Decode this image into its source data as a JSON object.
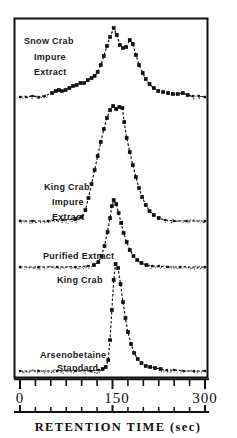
{
  "figure": {
    "domain": "chart",
    "background_color": "#ffffff",
    "ink_color": "#101010",
    "frame": {
      "left": 14,
      "top": 18,
      "right": 208,
      "bottom": 378
    }
  },
  "axis": {
    "x_title": "RETENTION  TIME   (sec)",
    "x_tick_labels": [
      "0",
      "150",
      "300"
    ],
    "x_tick_label_values": [
      0,
      150,
      300
    ],
    "x_minor_ticks": [
      25,
      50,
      75,
      100,
      125,
      175,
      200,
      225,
      250,
      275
    ],
    "x_min": 0,
    "x_max": 300,
    "x_units": "sec",
    "y_axis_label": "",
    "y_ticks_shown": false,
    "grid": false
  },
  "labels": {
    "trace1_line1": "Snow Crab",
    "trace1_line2": "Impure",
    "trace1_line3": "Extract",
    "trace2_line1": "King Crab",
    "trace2_line2": "Impure",
    "trace2_line3": "Extract",
    "trace3_line1": "Purified Extract",
    "trace3_line2": "King Crab",
    "trace4_line1": "Arsenobetaine",
    "trace4_line2": "Standard"
  },
  "chart_data": {
    "type": "line",
    "title": "",
    "subtitle": "",
    "xlabel": "RETENTION  TIME   (sec)",
    "ylabel": "",
    "xlim": [
      0,
      300
    ],
    "grid": false,
    "legend": "inline-annotations",
    "marker": "filled-square",
    "line_style": "dotted-dashed",
    "note": "Four stacked HPLC chromatogram traces with offset baselines; y is detector response in arbitrary units relative to each trace's own baseline.",
    "series": [
      {
        "name": "Snow Crab Impure Extract",
        "baseline_y_px": 98,
        "peak_retention_sec": 152,
        "secondary_peak_retention_sec": 178,
        "points": [
          {
            "x": 0,
            "y": 1
          },
          {
            "x": 10,
            "y": 1
          },
          {
            "x": 20,
            "y": 2
          },
          {
            "x": 30,
            "y": 1
          },
          {
            "x": 40,
            "y": 2
          },
          {
            "x": 52,
            "y": 5
          },
          {
            "x": 58,
            "y": 7
          },
          {
            "x": 63,
            "y": 8
          },
          {
            "x": 68,
            "y": 7
          },
          {
            "x": 74,
            "y": 8
          },
          {
            "x": 80,
            "y": 10
          },
          {
            "x": 86,
            "y": 12
          },
          {
            "x": 92,
            "y": 13
          },
          {
            "x": 98,
            "y": 15
          },
          {
            "x": 104,
            "y": 15
          },
          {
            "x": 110,
            "y": 18
          },
          {
            "x": 116,
            "y": 20
          },
          {
            "x": 121,
            "y": 22
          },
          {
            "x": 126,
            "y": 26
          },
          {
            "x": 131,
            "y": 33
          },
          {
            "x": 136,
            "y": 42
          },
          {
            "x": 141,
            "y": 52
          },
          {
            "x": 146,
            "y": 61
          },
          {
            "x": 152,
            "y": 70
          },
          {
            "x": 157,
            "y": 63
          },
          {
            "x": 162,
            "y": 53
          },
          {
            "x": 167,
            "y": 50
          },
          {
            "x": 172,
            "y": 51
          },
          {
            "x": 178,
            "y": 58
          },
          {
            "x": 183,
            "y": 54
          },
          {
            "x": 188,
            "y": 43
          },
          {
            "x": 193,
            "y": 33
          },
          {
            "x": 199,
            "y": 25
          },
          {
            "x": 204,
            "y": 19
          },
          {
            "x": 210,
            "y": 14
          },
          {
            "x": 217,
            "y": 10
          },
          {
            "x": 224,
            "y": 7
          },
          {
            "x": 232,
            "y": 6
          },
          {
            "x": 240,
            "y": 5
          },
          {
            "x": 248,
            "y": 4
          },
          {
            "x": 256,
            "y": 4
          },
          {
            "x": 264,
            "y": 5
          },
          {
            "x": 272,
            "y": 3
          },
          {
            "x": 280,
            "y": 2
          },
          {
            "x": 290,
            "y": 2
          },
          {
            "x": 300,
            "y": 1
          }
        ]
      },
      {
        "name": "King Crab Impure Extract",
        "baseline_y_px": 222,
        "peak_retention_sec": 151,
        "points": [
          {
            "x": 0,
            "y": 1
          },
          {
            "x": 20,
            "y": 1
          },
          {
            "x": 45,
            "y": 1
          },
          {
            "x": 70,
            "y": 2
          },
          {
            "x": 90,
            "y": 3
          },
          {
            "x": 100,
            "y": 5
          },
          {
            "x": 106,
            "y": 12
          },
          {
            "x": 111,
            "y": 24
          },
          {
            "x": 116,
            "y": 38
          },
          {
            "x": 121,
            "y": 52
          },
          {
            "x": 126,
            "y": 66
          },
          {
            "x": 131,
            "y": 80
          },
          {
            "x": 136,
            "y": 93
          },
          {
            "x": 141,
            "y": 104
          },
          {
            "x": 146,
            "y": 112
          },
          {
            "x": 151,
            "y": 116
          },
          {
            "x": 156,
            "y": 113
          },
          {
            "x": 161,
            "y": 115
          },
          {
            "x": 166,
            "y": 114
          },
          {
            "x": 169,
            "y": 100
          },
          {
            "x": 173,
            "y": 84
          },
          {
            "x": 178,
            "y": 70
          },
          {
            "x": 183,
            "y": 57
          },
          {
            "x": 188,
            "y": 45
          },
          {
            "x": 193,
            "y": 34
          },
          {
            "x": 198,
            "y": 25
          },
          {
            "x": 204,
            "y": 17
          },
          {
            "x": 210,
            "y": 11
          },
          {
            "x": 217,
            "y": 7
          },
          {
            "x": 225,
            "y": 4
          },
          {
            "x": 235,
            "y": 2
          },
          {
            "x": 250,
            "y": 1
          },
          {
            "x": 270,
            "y": 1
          },
          {
            "x": 300,
            "y": 1
          }
        ]
      },
      {
        "name": "Purified Extract King Crab",
        "baseline_y_px": 268,
        "peak_retention_sec": 152,
        "points": [
          {
            "x": 0,
            "y": 1
          },
          {
            "x": 30,
            "y": 1
          },
          {
            "x": 60,
            "y": 1
          },
          {
            "x": 90,
            "y": 1
          },
          {
            "x": 110,
            "y": 2
          },
          {
            "x": 120,
            "y": 3
          },
          {
            "x": 127,
            "y": 6
          },
          {
            "x": 132,
            "y": 12
          },
          {
            "x": 137,
            "y": 22
          },
          {
            "x": 142,
            "y": 36
          },
          {
            "x": 146,
            "y": 50
          },
          {
            "x": 149,
            "y": 62
          },
          {
            "x": 152,
            "y": 68
          },
          {
            "x": 156,
            "y": 64
          },
          {
            "x": 160,
            "y": 55
          },
          {
            "x": 164,
            "y": 45
          },
          {
            "x": 168,
            "y": 35
          },
          {
            "x": 173,
            "y": 26
          },
          {
            "x": 178,
            "y": 18
          },
          {
            "x": 184,
            "y": 12
          },
          {
            "x": 190,
            "y": 8
          },
          {
            "x": 197,
            "y": 5
          },
          {
            "x": 205,
            "y": 3
          },
          {
            "x": 214,
            "y": 2
          },
          {
            "x": 225,
            "y": 2
          },
          {
            "x": 240,
            "y": 1
          },
          {
            "x": 260,
            "y": 1
          },
          {
            "x": 300,
            "y": 1
          }
        ]
      },
      {
        "name": "Arsenobetaine Standard",
        "baseline_y_px": 372,
        "peak_retention_sec": 153,
        "points": [
          {
            "x": 0,
            "y": 1
          },
          {
            "x": 30,
            "y": 1
          },
          {
            "x": 60,
            "y": 1
          },
          {
            "x": 90,
            "y": 1
          },
          {
            "x": 115,
            "y": 1
          },
          {
            "x": 128,
            "y": 2
          },
          {
            "x": 134,
            "y": 3
          },
          {
            "x": 139,
            "y": 5
          },
          {
            "x": 143,
            "y": 12
          },
          {
            "x": 146,
            "y": 32
          },
          {
            "x": 149,
            "y": 62
          },
          {
            "x": 152,
            "y": 92
          },
          {
            "x": 155,
            "y": 108
          },
          {
            "x": 159,
            "y": 104
          },
          {
            "x": 163,
            "y": 88
          },
          {
            "x": 167,
            "y": 70
          },
          {
            "x": 171,
            "y": 54
          },
          {
            "x": 175,
            "y": 40
          },
          {
            "x": 180,
            "y": 28
          },
          {
            "x": 185,
            "y": 19
          },
          {
            "x": 191,
            "y": 13
          },
          {
            "x": 197,
            "y": 9
          },
          {
            "x": 204,
            "y": 6
          },
          {
            "x": 211,
            "y": 5
          },
          {
            "x": 219,
            "y": 4
          },
          {
            "x": 228,
            "y": 3
          },
          {
            "x": 238,
            "y": 2
          },
          {
            "x": 250,
            "y": 2
          },
          {
            "x": 265,
            "y": 1
          },
          {
            "x": 282,
            "y": 1
          },
          {
            "x": 300,
            "y": 1
          }
        ]
      }
    ]
  }
}
